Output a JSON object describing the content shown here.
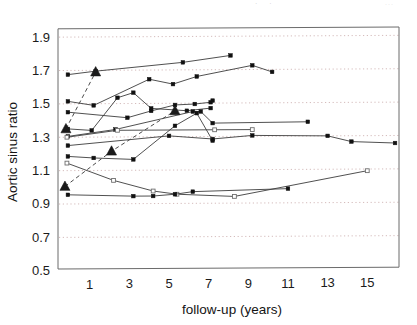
{
  "figure": {
    "faint_header_left": "·  ·",
    "faint_header_right": "···"
  },
  "chart_data": {
    "type": "line",
    "title": "",
    "xlabel": "follow-up (years)",
    "ylabel": "Aortic sinus ratio",
    "xlim": [
      -0.6,
      16.6
    ],
    "ylim": [
      0.5,
      1.95
    ],
    "xticks": [
      1,
      3,
      5,
      7,
      9,
      11,
      13,
      15
    ],
    "xtick_labels": [
      "1",
      "3",
      "5",
      "7",
      "9",
      "11",
      "13",
      "15"
    ],
    "yticks": [
      0.5,
      0.7,
      0.9,
      1.1,
      1.3,
      1.5,
      1.7,
      1.9
    ],
    "ytick_labels": [
      "0.5",
      "0.7",
      "0.9",
      "1.1",
      "1.3",
      "1.5",
      "1.7",
      "1.9"
    ],
    "grid": "horizontal-dotted",
    "legend": "none",
    "marker_styles": {
      "filled_square": "individual patient measurement",
      "open_square": "individual patient measurement (open)",
      "triangle": "group mean on dashed trend line"
    },
    "series": [
      {
        "name": "patient-1",
        "marker": "filled-square",
        "line": "solid",
        "points": [
          [
            -0.1,
            1.675
          ],
          [
            1.3,
            1.695
          ],
          [
            5.7,
            1.745
          ],
          [
            8.1,
            1.785
          ]
        ]
      },
      {
        "name": "patient-2",
        "marker": "filled-square",
        "line": "solid",
        "points": [
          [
            -0.1,
            1.515
          ],
          [
            1.2,
            1.49
          ],
          [
            4.0,
            1.645
          ],
          [
            5.2,
            1.615
          ],
          [
            6.4,
            1.66
          ],
          [
            9.2,
            1.725
          ],
          [
            10.2,
            1.685
          ]
        ]
      },
      {
        "name": "patient-3",
        "marker": "filled-square",
        "line": "solid",
        "points": [
          [
            -0.1,
            1.45
          ],
          [
            2.9,
            1.415
          ],
          [
            4.1,
            1.455
          ],
          [
            5.3,
            1.49
          ],
          [
            6.3,
            1.495
          ],
          [
            7.1,
            1.505
          ],
          [
            7.2,
            1.515
          ]
        ]
      },
      {
        "name": "patient-4",
        "marker": "filled-square",
        "line": "solid",
        "points": [
          [
            -0.1,
            1.35
          ],
          [
            1.1,
            1.34
          ],
          [
            2.4,
            1.535
          ],
          [
            3.2,
            1.565
          ],
          [
            4.1,
            1.47
          ],
          [
            5.9,
            1.455
          ],
          [
            7.1,
            1.47
          ]
        ]
      },
      {
        "name": "patient-5",
        "marker": "filled-square",
        "line": "solid",
        "points": [
          [
            -0.1,
            1.305
          ],
          [
            2.3,
            1.345
          ],
          [
            6.2,
            1.45
          ],
          [
            6.6,
            1.45
          ],
          [
            7.2,
            1.38
          ],
          [
            12.0,
            1.385
          ]
        ]
      },
      {
        "name": "patient-6",
        "marker": "open-square",
        "line": "solid",
        "points": [
          [
            -0.15,
            1.3
          ],
          [
            2.4,
            1.34
          ],
          [
            7.3,
            1.34
          ],
          [
            9.2,
            1.34
          ]
        ]
      },
      {
        "name": "patient-7",
        "marker": "filled-square",
        "line": "solid",
        "points": [
          [
            -0.1,
            1.25
          ],
          [
            5.0,
            1.305
          ],
          [
            7.2,
            1.285
          ],
          [
            9.2,
            1.305
          ],
          [
            13.0,
            1.3
          ],
          [
            14.2,
            1.265
          ],
          [
            16.4,
            1.255
          ]
        ]
      },
      {
        "name": "patient-8",
        "marker": "filled-square",
        "line": "solid",
        "points": [
          [
            -0.1,
            1.185
          ],
          [
            1.2,
            1.175
          ],
          [
            3.2,
            1.165
          ],
          [
            5.3,
            1.365
          ],
          [
            6.4,
            1.44
          ],
          [
            7.2,
            1.275
          ]
        ]
      },
      {
        "name": "patient-9",
        "marker": "open-square",
        "line": "solid",
        "points": [
          [
            -0.15,
            1.145
          ],
          [
            2.2,
            1.04
          ],
          [
            4.2,
            0.975
          ],
          [
            5.4,
            0.955
          ],
          [
            8.3,
            0.94
          ],
          [
            15.0,
            1.09
          ]
        ]
      },
      {
        "name": "patient-10",
        "marker": "filled-square",
        "line": "solid",
        "points": [
          [
            -0.1,
            0.955
          ],
          [
            3.2,
            0.945
          ],
          [
            4.2,
            0.945
          ],
          [
            5.3,
            0.955
          ],
          [
            6.2,
            0.97
          ],
          [
            11.0,
            0.985
          ]
        ]
      },
      {
        "name": "mean-trend-a",
        "marker": "triangle",
        "line": "dashed",
        "points": [
          [
            -0.2,
            1.35
          ],
          [
            1.3,
            1.69
          ]
        ]
      },
      {
        "name": "mean-trend-b",
        "marker": "triangle",
        "line": "dashed",
        "points": [
          [
            -0.25,
            1.005
          ],
          [
            2.1,
            1.215
          ],
          [
            5.3,
            1.455
          ]
        ]
      }
    ]
  }
}
